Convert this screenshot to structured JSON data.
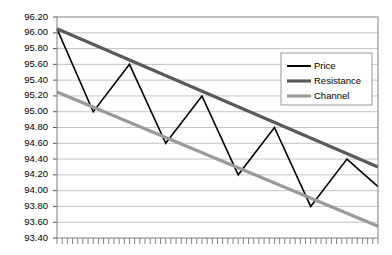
{
  "chart_data": {
    "type": "line",
    "title": "",
    "xlabel": "",
    "ylabel": "",
    "ylim": [
      93.4,
      96.2
    ],
    "ytick_step": 0.2,
    "ytick_labels": [
      "96.20",
      "96.00",
      "95.80",
      "95.60",
      "95.40",
      "95.20",
      "95.00",
      "94.80",
      "94.60",
      "94.40",
      "94.20",
      "94.00",
      "93.80",
      "93.60",
      "93.40"
    ],
    "ytick_values": [
      96.2,
      96.0,
      95.8,
      95.6,
      95.4,
      95.2,
      95.0,
      94.8,
      94.6,
      94.4,
      94.2,
      94.0,
      93.8,
      93.6,
      93.4
    ],
    "grid": true,
    "grid_axis": "y",
    "xlim": [
      0,
      62
    ],
    "x_tick_count": 63,
    "x_tick_labels": [],
    "legend_position": "top-right",
    "series": [
      {
        "name": "Price",
        "color": "#000000",
        "width": 1.6,
        "x": [
          0,
          7,
          14,
          21,
          28,
          35,
          42,
          49,
          56,
          62
        ],
        "values": [
          96.05,
          95.0,
          95.6,
          94.6,
          95.2,
          94.2,
          94.8,
          93.8,
          94.4,
          94.05
        ]
      },
      {
        "name": "Resistance",
        "color": "#5a5a5a",
        "width": 3.2,
        "x": [
          0,
          62
        ],
        "values": [
          96.05,
          94.3
        ]
      },
      {
        "name": "Channel",
        "color": "#9a9a9a",
        "width": 3.2,
        "x": [
          0,
          62
        ],
        "values": [
          95.25,
          93.55
        ]
      }
    ]
  },
  "legend": {
    "items": [
      {
        "label": "Price"
      },
      {
        "label": "Resistance"
      },
      {
        "label": "Channel"
      }
    ]
  }
}
